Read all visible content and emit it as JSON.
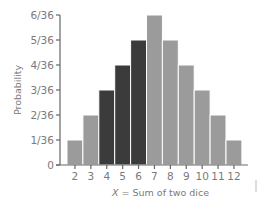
{
  "chart_data": {
    "type": "bar",
    "title": "",
    "xlabel": "X = Sum of two dice",
    "xlabel_var": "X",
    "xlabel_rest": " = Sum of two dice",
    "ylabel": "Probability",
    "categories": [
      "2",
      "3",
      "4",
      "5",
      "6",
      "7",
      "8",
      "9",
      "10",
      "11",
      "12"
    ],
    "values": [
      1,
      2,
      3,
      4,
      5,
      6,
      5,
      4,
      3,
      2,
      1
    ],
    "values_fraction": [
      "1/36",
      "2/36",
      "3/36",
      "4/36",
      "5/36",
      "6/36",
      "5/36",
      "4/36",
      "3/36",
      "2/36",
      "1/36"
    ],
    "highlighted_categories": [
      "4",
      "5",
      "6"
    ],
    "ylim": [
      0,
      6
    ],
    "yticks": [
      "0",
      "1/36",
      "2/36",
      "3/36",
      "4/36",
      "5/36",
      "6/36"
    ],
    "grid": false,
    "legend": null,
    "colors": {
      "bar": "#9b9b9b",
      "highlight": "#3b3b3b",
      "axis": "#666666"
    }
  }
}
